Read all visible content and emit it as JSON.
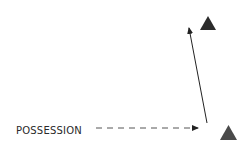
{
  "diagram": {
    "label": "POSSESSION",
    "colors": {
      "background": "#ffffff",
      "text": "#2a2a2a",
      "arrow": "#222222",
      "dashed_arrow": "#555555",
      "triangle_top": "#2b2b2b",
      "triangle_bottom": "#4a4a4a"
    },
    "elements": [
      {
        "type": "triangle",
        "name": "player-marker-top",
        "points": "200,30 208,16 216,30"
      },
      {
        "type": "triangle",
        "name": "player-marker-bottom",
        "points": "220,140 228.5,125 237,140"
      },
      {
        "type": "solid-arrow",
        "name": "pass-arrow",
        "from": [
          207,
          123
        ],
        "to": [
          188,
          25
        ]
      },
      {
        "type": "dashed-arrow",
        "name": "possession-arrow",
        "from": [
          96,
          128
        ],
        "to": [
          200,
          128
        ]
      }
    ]
  }
}
